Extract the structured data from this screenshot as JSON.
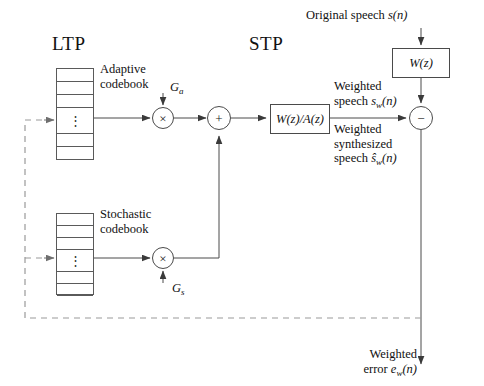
{
  "diagram": {
    "title_ltp": "LTP",
    "title_stp": "STP",
    "headings": {
      "ltp": "LTP",
      "stp": "STP"
    },
    "blocks": {
      "adaptive_codebook_label_line1": "Adaptive",
      "adaptive_codebook_label_line2": "codebook",
      "stochastic_codebook_label_line1": "Stochastic",
      "stochastic_codebook_label_line2": "codebook",
      "perceptual_filter": "W(z)",
      "synthesis_filter": "W(z)/A(z)",
      "dots": "⋮"
    },
    "operators": {
      "gain_multiply_adaptive": "×",
      "gain_multiply_stochastic": "×",
      "summer": "+",
      "subtractor": "−"
    },
    "gains": {
      "adaptive_gain": "G",
      "adaptive_gain_sub": "a",
      "stochastic_gain": "G",
      "stochastic_gain_sub": "s"
    },
    "signals": {
      "original_speech_text": "Original speech ",
      "original_speech_var": "s",
      "original_speech_arg": "(n)",
      "weighted_speech_l1": "Weighted",
      "weighted_speech_l2_text": "speech ",
      "weighted_speech_var": "s",
      "weighted_speech_sub": "w",
      "weighted_speech_arg": "(n)",
      "weighted_synth_l1": "Weighted",
      "weighted_synth_l2": "synthesized",
      "weighted_synth_l3_text": "speech ",
      "weighted_synth_var": "ŝ",
      "weighted_synth_sub": "w",
      "weighted_synth_arg": "(n)",
      "weighted_error_l1": "Weighted",
      "weighted_error_l2_text": "error ",
      "weighted_error_var": "e",
      "weighted_error_sub": "w",
      "weighted_error_arg": "(n)"
    },
    "codebook_rows": {
      "adaptive": [
        "row-1",
        "row-2",
        "row-3",
        "dots-row",
        "row-5",
        "row-6",
        "row-7"
      ],
      "stochastic": [
        "row-1",
        "row-2",
        "row-3",
        "dots-row",
        "row-5",
        "row-6",
        "row-7"
      ]
    },
    "colors": {
      "stroke": "#4a4a4a",
      "stroke_light": "#5a5a5a",
      "dashed": "#9a9a9a",
      "text": "#111111",
      "background": "#ffffff"
    }
  }
}
